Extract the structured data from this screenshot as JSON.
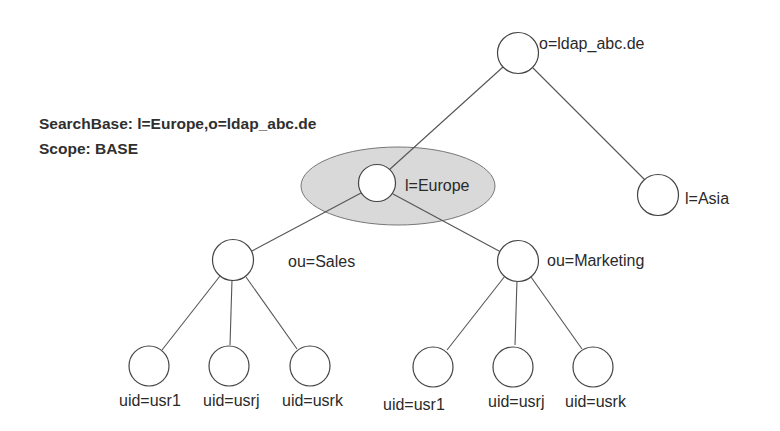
{
  "query": {
    "searchbase": "SearchBase:  l=Europe,o=ldap_abc.de",
    "scope": "Scope: BASE"
  },
  "tree": {
    "root": {
      "label": "o=ldap_abc.de"
    },
    "europe": {
      "label": "l=Europe",
      "highlighted": true
    },
    "asia": {
      "label": "l=Asia"
    },
    "sales": {
      "label": "ou=Sales",
      "children": [
        "uid=usr1",
        "uid=usrj",
        "uid=usrk"
      ]
    },
    "marketing": {
      "label": "ou=Marketing",
      "children": [
        "uid=usr1",
        "uid=usrj",
        "uid=usrk"
      ]
    }
  },
  "colors": {
    "highlight_fill": "#d9d9d9",
    "line": "#555555",
    "text": "#2a2a2a"
  }
}
